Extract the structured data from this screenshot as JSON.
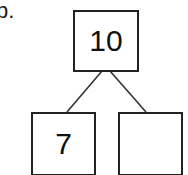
{
  "problem_label": "b.",
  "bond": {
    "whole": "10",
    "parts": [
      "7",
      ""
    ]
  },
  "colors": {
    "stroke": "#222222",
    "text": "#111111"
  }
}
